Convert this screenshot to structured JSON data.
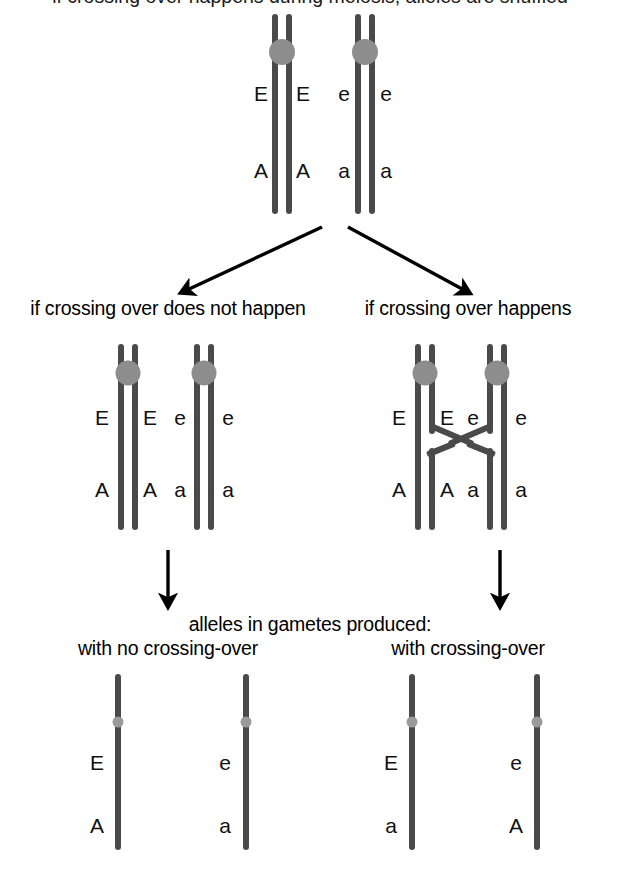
{
  "diagram": {
    "title": "if crossing over happens during meiosis, alleles are shuffled",
    "top_title": "",
    "branch_labels": {
      "left": "if crossing over does not happen",
      "right": "if crossing over happens"
    },
    "gametes_heading": "alleles in gametes produced:",
    "gamete_labels": {
      "left": "with no crossing-over",
      "right": "with crossing-over"
    },
    "colors": {
      "chromatid": "#4a4a4a",
      "centromere": "#8d8d8d",
      "centromere_small": "#9a9a9a",
      "arrow": "#000000",
      "text": "#000000",
      "background": "#ffffff"
    }
  },
  "top_pair": {
    "name": "parental homologous chromosome pair",
    "chromosomes": [
      {
        "name": "chromosome-1",
        "alleles_upper": [
          "E",
          "E"
        ],
        "alleles_lower": [
          "A",
          "A"
        ]
      },
      {
        "name": "chromosome-2",
        "alleles_upper": [
          "e",
          "e"
        ],
        "alleles_lower": [
          "a",
          "a"
        ]
      }
    ]
  },
  "middle_left": {
    "name": "no-crossing-over",
    "chromosomes": [
      {
        "name": "chromosome-1",
        "alleles_upper": [
          "E",
          "E"
        ],
        "alleles_lower": [
          "A",
          "A"
        ]
      },
      {
        "name": "chromosome-2",
        "alleles_upper": [
          "e",
          "e"
        ],
        "alleles_lower": [
          "a",
          "a"
        ]
      }
    ]
  },
  "middle_right": {
    "name": "crossing-over",
    "chromosomes": [
      {
        "name": "chromosome-1",
        "alleles_upper": [
          "E",
          "E"
        ],
        "alleles_lower": [
          "A",
          "A"
        ]
      },
      {
        "name": "chromosome-2",
        "alleles_upper": [
          "e",
          "e"
        ],
        "alleles_lower": [
          "a",
          "a"
        ]
      }
    ]
  },
  "gametes": {
    "left": [
      {
        "name": "gamete-EA",
        "upper": "E",
        "lower": "A"
      },
      {
        "name": "gamete-ea",
        "upper": "e",
        "lower": "a"
      }
    ],
    "right": [
      {
        "name": "gamete-Ea",
        "upper": "E",
        "lower": "a"
      },
      {
        "name": "gamete-eA",
        "upper": "e",
        "lower": "A"
      }
    ]
  }
}
